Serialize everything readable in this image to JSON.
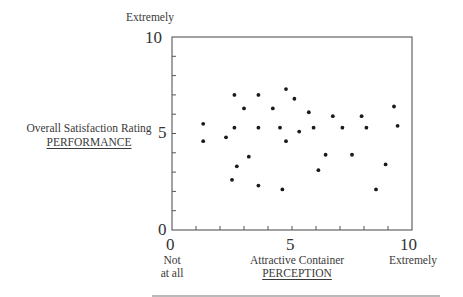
{
  "chart_data": {
    "type": "scatter",
    "title": "",
    "xlabel": "Attractive Container",
    "xlabel_sub": "PERCEPTION",
    "ylabel": "Overall Satisfaction Rating",
    "ylabel_sub": "PERFORMANCE",
    "xlim": [
      0,
      10
    ],
    "ylim": [
      0,
      10
    ],
    "x_ticks": [
      0,
      1,
      2,
      3,
      4,
      5,
      6,
      7,
      8,
      9,
      10
    ],
    "y_ticks": [
      0,
      1,
      2,
      3,
      4,
      5,
      6,
      7,
      8,
      9,
      10
    ],
    "x_tick_labels": [
      "0",
      "5",
      "10"
    ],
    "y_tick_labels": [
      "0",
      "5",
      "10"
    ],
    "x_anchor_low": "Not at all",
    "x_anchor_high": "Extremely",
    "y_anchor_high": "Extremely",
    "grid": false,
    "legend": null,
    "points": [
      {
        "x": 1.3,
        "y": 5.5
      },
      {
        "x": 1.3,
        "y": 4.6
      },
      {
        "x": 2.25,
        "y": 4.8
      },
      {
        "x": 2.5,
        "y": 2.6
      },
      {
        "x": 2.6,
        "y": 7.0
      },
      {
        "x": 2.6,
        "y": 5.3
      },
      {
        "x": 2.7,
        "y": 3.3
      },
      {
        "x": 3.0,
        "y": 6.3
      },
      {
        "x": 3.2,
        "y": 3.8
      },
      {
        "x": 3.6,
        "y": 7.0
      },
      {
        "x": 3.6,
        "y": 5.3
      },
      {
        "x": 3.6,
        "y": 2.3
      },
      {
        "x": 4.2,
        "y": 6.3
      },
      {
        "x": 4.5,
        "y": 5.3
      },
      {
        "x": 4.6,
        "y": 2.1
      },
      {
        "x": 4.75,
        "y": 7.3
      },
      {
        "x": 4.75,
        "y": 4.6
      },
      {
        "x": 5.1,
        "y": 6.8
      },
      {
        "x": 5.3,
        "y": 5.1
      },
      {
        "x": 5.7,
        "y": 6.1
      },
      {
        "x": 5.9,
        "y": 5.3
      },
      {
        "x": 6.1,
        "y": 3.1
      },
      {
        "x": 6.4,
        "y": 3.9
      },
      {
        "x": 6.7,
        "y": 5.9
      },
      {
        "x": 7.1,
        "y": 5.3
      },
      {
        "x": 7.5,
        "y": 3.9
      },
      {
        "x": 7.9,
        "y": 5.9
      },
      {
        "x": 8.1,
        "y": 5.3
      },
      {
        "x": 8.5,
        "y": 2.1
      },
      {
        "x": 8.9,
        "y": 3.4
      },
      {
        "x": 9.25,
        "y": 6.4
      },
      {
        "x": 9.4,
        "y": 5.4
      }
    ]
  },
  "labels": {
    "y_top_anchor": "Extremely",
    "y_tick_10": "10",
    "y_tick_5": "5",
    "y_tick_0": "0",
    "y_title": "Overall Satisfaction Rating",
    "y_subtitle": "PERFORMANCE",
    "x_tick_0": "0",
    "x_tick_5": "5",
    "x_tick_10": "10",
    "x_low_line1": "Not",
    "x_low_line2": "at all",
    "x_title": "Attractive Container",
    "x_subtitle": "PERCEPTION",
    "x_high_anchor": "Extremely"
  },
  "style": {
    "axis_color": "#555555",
    "point_color": "#1a1a1a",
    "text_color": "#3a3a3a"
  }
}
